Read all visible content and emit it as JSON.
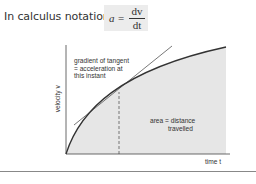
{
  "header": {
    "text": "In calculus notation",
    "equation": {
      "lhs": "a",
      "equals": "=",
      "numerator": "dv",
      "denominator": "dt"
    }
  },
  "diagram": {
    "y_axis_label": "velocity v",
    "x_axis_label": "time t",
    "annotations": {
      "gradient_line1": "gradient of tangent",
      "gradient_line2": "= acceleration at",
      "gradient_line3": "this instant",
      "area_line1": "area = distance",
      "area_line2": "travelled"
    },
    "colors": {
      "shading": "#e6e6e6",
      "curve": "#333333",
      "tangent": "#555555",
      "axes": "#444444",
      "equation_box": "#ececec"
    }
  }
}
